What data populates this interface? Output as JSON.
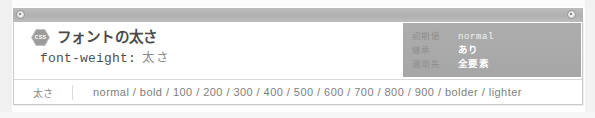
{
  "card": {
    "badge": {
      "icon": "hexagon-badge",
      "label": "CSS",
      "color": "#9c9c9c"
    },
    "title": "フォントの太さ",
    "syntax": {
      "property": "font-weight:",
      "value": "太さ"
    },
    "meta_panel": {
      "background": "#a9a9a9",
      "rows": [
        {
          "label": "初期値",
          "value": "normal",
          "mono": true
        },
        {
          "label": "継承",
          "value": "あり",
          "mono": false
        },
        {
          "label": "適用先",
          "value": "全要素",
          "mono": false
        }
      ]
    },
    "values_row": {
      "label": "太さ",
      "values": "normal / bold / 100 / 200 / 300 / 400 / 500 / 600 / 700 / 800 / 900 / bolder / lighter"
    }
  },
  "chrome": {
    "header_band_color": "#b4b4b4",
    "corner_marker_left": "circle-marker",
    "corner_marker_right": "circle-marker"
  }
}
